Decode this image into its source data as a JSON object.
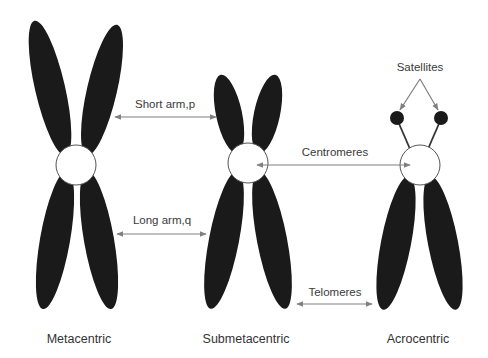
{
  "diagram": {
    "colors": {
      "chromatid": "#1a1a1a",
      "centromere_fill": "#ffffff",
      "arrow": "#808080",
      "text": "#333333"
    },
    "chromosomes": [
      {
        "id": "metacentric",
        "label": "Metacentric"
      },
      {
        "id": "submetacentric",
        "label": "Submetacentric"
      },
      {
        "id": "acrocentric",
        "label": "Acrocentric"
      }
    ],
    "annotations": {
      "short_arm": "Short arm,p",
      "long_arm": "Long arm,q",
      "centromeres": "Centromeres",
      "telomeres": "Telomeres",
      "satellites": "Satellites"
    }
  }
}
